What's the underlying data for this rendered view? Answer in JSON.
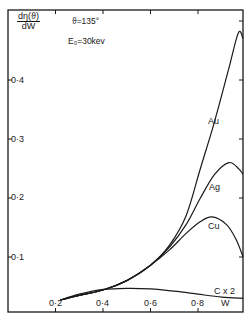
{
  "chart_data": {
    "type": "line",
    "title": "",
    "annotations": [
      "ϑ=135°",
      "E₀=30kev"
    ],
    "xlabel": "W",
    "ylabel_numerator": "dη(ϑ)",
    "ylabel_denominator": "dW",
    "xlim": [
      0.0,
      1.0
    ],
    "ylim": [
      0.0,
      0.53
    ],
    "xticks": [
      "0·2",
      "0·4",
      "0·6",
      "0·8"
    ],
    "xtick_values": [
      0.2,
      0.4,
      0.6,
      0.8
    ],
    "yticks": [
      "0·1",
      "0·2",
      "0·3",
      "0·4"
    ],
    "ytick_values": [
      0.1,
      0.2,
      0.3,
      0.4
    ],
    "grid": false,
    "legend": "inline labels",
    "series": [
      {
        "name": "Au",
        "x": [
          0.22,
          0.3,
          0.4,
          0.5,
          0.6,
          0.68,
          0.75,
          0.81,
          0.87,
          0.93,
          0.97,
          0.99
        ],
        "y": [
          0.027,
          0.035,
          0.044,
          0.06,
          0.086,
          0.12,
          0.17,
          0.25,
          0.33,
          0.42,
          0.48,
          0.47
        ]
      },
      {
        "name": "Ag",
        "x": [
          0.22,
          0.3,
          0.4,
          0.5,
          0.6,
          0.68,
          0.75,
          0.81,
          0.87,
          0.93,
          0.97,
          0.99
        ],
        "y": [
          0.027,
          0.035,
          0.044,
          0.06,
          0.086,
          0.117,
          0.155,
          0.2,
          0.24,
          0.26,
          0.25,
          0.24
        ]
      },
      {
        "name": "Cu",
        "x": [
          0.22,
          0.3,
          0.4,
          0.5,
          0.6,
          0.68,
          0.75,
          0.81,
          0.86,
          0.92,
          0.96,
          0.99
        ],
        "y": [
          0.027,
          0.035,
          0.044,
          0.06,
          0.086,
          0.112,
          0.14,
          0.16,
          0.168,
          0.155,
          0.13,
          0.1
        ]
      },
      {
        "name": "C x 2",
        "x": [
          0.22,
          0.3,
          0.4,
          0.5,
          0.6,
          0.7,
          0.8,
          0.9,
          0.99
        ],
        "y": [
          0.027,
          0.037,
          0.045,
          0.047,
          0.046,
          0.042,
          0.037,
          0.032,
          0.03
        ]
      }
    ]
  }
}
